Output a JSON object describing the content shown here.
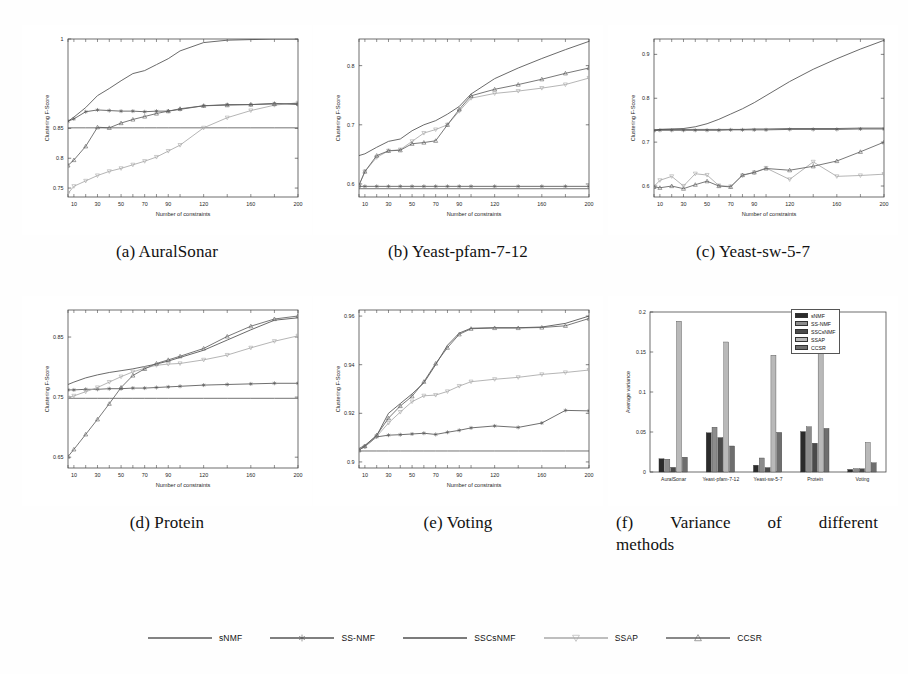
{
  "figure": {
    "axis_labels": {
      "x": "Number of constraints",
      "y": "Clustering F-Score"
    },
    "methods": [
      {
        "key": "sNMF",
        "label": "sNMF",
        "color": "#5a5a5a",
        "marker": "none",
        "bar_color": "#2b2b2b"
      },
      {
        "key": "SSNMF",
        "label": "SS-NMF",
        "color": "#555555",
        "marker": "asterisk",
        "bar_color": "#8c8c8c"
      },
      {
        "key": "SSCsNMF",
        "label": "SSCsNMF",
        "color": "#4f4f4f",
        "marker": "none",
        "bar_color": "#4a4a4a"
      },
      {
        "key": "SSAP",
        "label": "SSAP",
        "color": "#a8a8a8",
        "marker": "triangle-down",
        "bar_color": "#b9b9b9"
      },
      {
        "key": "CCSR",
        "label": "CCSR",
        "color": "#606060",
        "marker": "triangle-up",
        "bar_color": "#6e6e6e"
      }
    ]
  },
  "panels": {
    "a": {
      "tag": "(a)",
      "name": "AuralSonar",
      "caption": "(a) AuralSonar"
    },
    "b": {
      "tag": "(b)",
      "name": "Yeast-pfam-7-12",
      "caption": "(b) Yeast-pfam-7-12"
    },
    "c": {
      "tag": "(c)",
      "name": "Yeast-sw-5-7",
      "caption": "(c) Yeast-sw-5-7"
    },
    "d": {
      "tag": "(d)",
      "name": "Protein",
      "caption": "(d) Protein"
    },
    "e": {
      "tag": "(e)",
      "name": "Voting",
      "caption": "(e) Voting"
    },
    "f": {
      "tag": "(f)",
      "name": "Variance of different methods",
      "caption_line1_words": [
        "(f)",
        "Variance",
        "of",
        "different"
      ],
      "caption_line2": "methods"
    }
  },
  "chart_data": [
    {
      "id": "a",
      "type": "line",
      "title": "(a) AuralSonar",
      "xlabel": "Number of constraints",
      "ylabel": "Clustering F-Score",
      "x": [
        5,
        10,
        20,
        30,
        40,
        50,
        60,
        70,
        80,
        90,
        100,
        120,
        140,
        160,
        180,
        200
      ],
      "xticks": [
        10,
        30,
        50,
        70,
        90,
        120,
        160,
        200
      ],
      "xticklabels": [
        "10",
        "30",
        "50",
        "70",
        "90",
        "120",
        "160",
        "200"
      ],
      "yticks": [
        0.75,
        0.8,
        0.85,
        1
      ],
      "yticklabels": [
        "0.75",
        "0.8",
        "0.85",
        "1"
      ],
      "xlim": [
        5,
        200
      ],
      "ylim": [
        0.735,
        1.0
      ],
      "grid": false,
      "series": [
        {
          "name": "sNMF",
          "values": [
            0.851,
            0.851,
            0.851,
            0.851,
            0.851,
            0.851,
            0.851,
            0.851,
            0.851,
            0.851,
            0.851,
            0.851,
            0.851,
            0.851,
            0.851,
            0.851
          ]
        },
        {
          "name": "SS-NMF",
          "values": [
            0.862,
            0.866,
            0.878,
            0.881,
            0.88,
            0.879,
            0.879,
            0.878,
            0.879,
            0.879,
            0.882,
            0.888,
            0.89,
            0.89,
            0.892,
            0.89
          ]
        },
        {
          "name": "SSCsNMF",
          "values": [
            0.862,
            0.869,
            0.885,
            0.905,
            0.917,
            0.93,
            0.942,
            0.947,
            0.957,
            0.967,
            0.98,
            0.994,
            0.998,
            0.999,
            1.0,
            1.0
          ]
        },
        {
          "name": "SSAP",
          "values": [
            0.741,
            0.753,
            0.762,
            0.771,
            0.778,
            0.783,
            0.789,
            0.795,
            0.802,
            0.812,
            0.822,
            0.851,
            0.868,
            0.88,
            0.889,
            0.893
          ]
        },
        {
          "name": "CCSR",
          "values": [
            0.788,
            0.797,
            0.82,
            0.852,
            0.851,
            0.859,
            0.865,
            0.87,
            0.875,
            0.879,
            0.883,
            0.888,
            0.889,
            0.89,
            0.891,
            0.892
          ]
        }
      ]
    },
    {
      "id": "b",
      "type": "line",
      "title": "(b) Yeast-pfam-7-12",
      "xlabel": "Number of constraints",
      "ylabel": "Clustering F-Score",
      "x": [
        5,
        10,
        20,
        30,
        40,
        50,
        60,
        70,
        80,
        90,
        100,
        120,
        140,
        160,
        180,
        200
      ],
      "xticks": [
        10,
        30,
        50,
        70,
        90,
        120,
        160,
        200
      ],
      "xticklabels": [
        "10",
        "30",
        "50",
        "70",
        "90",
        "120",
        "160",
        "200"
      ],
      "yticks": [
        0.6,
        0.7,
        0.8
      ],
      "yticklabels": [
        "0.6",
        "0.7",
        "0.8"
      ],
      "xlim": [
        5,
        200
      ],
      "ylim": [
        0.578,
        0.845
      ],
      "grid": false,
      "series": [
        {
          "name": "sNMF",
          "values": [
            0.592,
            0.592,
            0.592,
            0.592,
            0.592,
            0.592,
            0.592,
            0.592,
            0.592,
            0.592,
            0.592,
            0.592,
            0.592,
            0.592,
            0.592,
            0.592
          ]
        },
        {
          "name": "SS-NMF",
          "values": [
            0.596,
            0.596,
            0.596,
            0.596,
            0.596,
            0.596,
            0.596,
            0.596,
            0.596,
            0.596,
            0.596,
            0.596,
            0.596,
            0.596,
            0.596,
            0.596
          ]
        },
        {
          "name": "SSCsNMF",
          "values": [
            0.648,
            0.651,
            0.662,
            0.672,
            0.676,
            0.69,
            0.7,
            0.707,
            0.718,
            0.731,
            0.752,
            0.778,
            0.796,
            0.812,
            0.827,
            0.841
          ]
        },
        {
          "name": "SSAP",
          "values": [
            0.598,
            0.621,
            0.645,
            0.656,
            0.658,
            0.672,
            0.686,
            0.692,
            0.7,
            0.723,
            0.745,
            0.753,
            0.757,
            0.762,
            0.768,
            0.779
          ]
        },
        {
          "name": "CCSR",
          "values": [
            0.598,
            0.621,
            0.648,
            0.656,
            0.657,
            0.668,
            0.67,
            0.673,
            0.7,
            0.726,
            0.749,
            0.76,
            0.768,
            0.777,
            0.787,
            0.796
          ]
        }
      ]
    },
    {
      "id": "c",
      "type": "line",
      "title": "(c) Yeast-sw-5-7",
      "xlabel": "Number of constraints",
      "ylabel": "Clustering F-Score",
      "x": [
        5,
        10,
        20,
        30,
        40,
        50,
        60,
        70,
        80,
        90,
        100,
        120,
        140,
        160,
        180,
        200
      ],
      "xticks": [
        10,
        30,
        50,
        70,
        90,
        120,
        160,
        200
      ],
      "xticklabels": [
        "10",
        "30",
        "50",
        "70",
        "90",
        "120",
        "160",
        "200"
      ],
      "yticks": [
        0.6,
        0.7,
        0.8,
        0.9
      ],
      "yticklabels": [
        "0.6",
        "0.7",
        "0.8",
        "0.9"
      ],
      "xlim": [
        5,
        200
      ],
      "ylim": [
        0.575,
        0.935
      ],
      "grid": false,
      "series": [
        {
          "name": "sNMF",
          "values": [
            0.728,
            0.729,
            0.729,
            0.729,
            0.729,
            0.729,
            0.729,
            0.729,
            0.729,
            0.73,
            0.73,
            0.731,
            0.731,
            0.731,
            0.732,
            0.732
          ]
        },
        {
          "name": "SS-NMF",
          "values": [
            0.726,
            0.727,
            0.727,
            0.727,
            0.727,
            0.727,
            0.727,
            0.728,
            0.728,
            0.728,
            0.728,
            0.729,
            0.729,
            0.729,
            0.73,
            0.73
          ]
        },
        {
          "name": "SSCsNMF",
          "values": [
            0.727,
            0.729,
            0.73,
            0.731,
            0.735,
            0.742,
            0.752,
            0.764,
            0.776,
            0.79,
            0.806,
            0.838,
            0.866,
            0.89,
            0.912,
            0.932
          ]
        },
        {
          "name": "SSAP",
          "values": [
            0.599,
            0.613,
            0.622,
            0.6,
            0.628,
            0.625,
            0.601,
            0.599,
            0.624,
            0.631,
            0.641,
            0.615,
            0.655,
            0.622,
            0.624,
            0.627
          ]
        },
        {
          "name": "CCSR",
          "values": [
            0.598,
            0.596,
            0.6,
            0.594,
            0.603,
            0.611,
            0.6,
            0.598,
            0.625,
            0.631,
            0.64,
            0.636,
            0.645,
            0.657,
            0.678,
            0.7
          ]
        }
      ]
    },
    {
      "id": "d",
      "type": "line",
      "title": "(d) Protein",
      "xlabel": "Number of constraints",
      "ylabel": "Clustering F-Score",
      "x": [
        5,
        10,
        20,
        30,
        40,
        50,
        60,
        70,
        80,
        90,
        100,
        120,
        140,
        160,
        180,
        200
      ],
      "xticks": [
        10,
        30,
        50,
        70,
        90,
        120,
        160,
        200
      ],
      "xticklabels": [
        "10",
        "30",
        "50",
        "70",
        "90",
        "120",
        "160",
        "200"
      ],
      "yticks": [
        0.65,
        0.75,
        0.85
      ],
      "yticklabels": [
        "0.65",
        "0.75",
        "0.85"
      ],
      "xlim": [
        5,
        200
      ],
      "ylim": [
        0.632,
        0.895
      ],
      "grid": false,
      "series": [
        {
          "name": "sNMF",
          "values": [
            0.748,
            0.748,
            0.748,
            0.748,
            0.748,
            0.748,
            0.748,
            0.748,
            0.748,
            0.748,
            0.748,
            0.748,
            0.748,
            0.748,
            0.748,
            0.748
          ]
        },
        {
          "name": "SS-NMF",
          "values": [
            0.762,
            0.762,
            0.763,
            0.763,
            0.764,
            0.764,
            0.765,
            0.765,
            0.766,
            0.767,
            0.768,
            0.77,
            0.771,
            0.772,
            0.773,
            0.773
          ]
        },
        {
          "name": "SSCsNMF",
          "values": [
            0.771,
            0.775,
            0.782,
            0.787,
            0.791,
            0.794,
            0.797,
            0.801,
            0.805,
            0.81,
            0.816,
            0.828,
            0.845,
            0.862,
            0.878,
            0.882
          ]
        },
        {
          "name": "SSAP",
          "values": [
            0.749,
            0.752,
            0.759,
            0.766,
            0.775,
            0.784,
            0.792,
            0.798,
            0.803,
            0.805,
            0.806,
            0.812,
            0.82,
            0.832,
            0.843,
            0.852
          ]
        },
        {
          "name": "CCSR",
          "values": [
            0.651,
            0.663,
            0.688,
            0.713,
            0.739,
            0.766,
            0.786,
            0.797,
            0.806,
            0.812,
            0.818,
            0.831,
            0.851,
            0.868,
            0.88,
            0.885
          ]
        }
      ]
    },
    {
      "id": "e",
      "type": "line",
      "title": "(e) Voting",
      "xlabel": "Number of constraints",
      "ylabel": "Clustering F-Score",
      "x": [
        5,
        10,
        20,
        30,
        40,
        50,
        60,
        70,
        80,
        90,
        100,
        120,
        140,
        160,
        180,
        200
      ],
      "xticks": [
        10,
        30,
        50,
        70,
        90,
        120,
        160,
        200
      ],
      "xticklabels": [
        "10",
        "30",
        "50",
        "70",
        "90",
        "120",
        "160",
        "200"
      ],
      "yticks": [
        0.9,
        0.92,
        0.94,
        0.96
      ],
      "yticklabels": [
        "0.9",
        "0.92",
        "0.94",
        "0.96"
      ],
      "xlim": [
        5,
        200
      ],
      "ylim": [
        0.8975,
        0.9625
      ],
      "grid": false,
      "series": [
        {
          "name": "sNMF",
          "values": [
            0.9045,
            0.9045,
            0.9045,
            0.9045,
            0.9045,
            0.9045,
            0.9045,
            0.9045,
            0.9045,
            0.9045,
            0.9045,
            0.9045,
            0.9045,
            0.9045,
            0.9045,
            0.9045
          ]
        },
        {
          "name": "SS-NMF",
          "values": [
            0.905,
            0.9063,
            0.9103,
            0.911,
            0.9112,
            0.9115,
            0.9118,
            0.9113,
            0.9122,
            0.913,
            0.914,
            0.9148,
            0.9142,
            0.916,
            0.9212,
            0.921
          ]
        },
        {
          "name": "SSCsNMF",
          "values": [
            0.9055,
            0.9068,
            0.9108,
            0.92,
            0.924,
            0.928,
            0.9325,
            0.94,
            0.948,
            0.953,
            0.955,
            0.9552,
            0.9552,
            0.9555,
            0.957,
            0.96
          ]
        },
        {
          "name": "SSAP",
          "values": [
            0.905,
            0.9063,
            0.9105,
            0.916,
            0.9205,
            0.9248,
            0.9272,
            0.9275,
            0.929,
            0.9312,
            0.933,
            0.934,
            0.9348,
            0.936,
            0.9368,
            0.9378
          ]
        },
        {
          "name": "CCSR",
          "values": [
            0.9048,
            0.9065,
            0.911,
            0.918,
            0.923,
            0.927,
            0.933,
            0.9405,
            0.947,
            0.9525,
            0.9548,
            0.9551,
            0.9551,
            0.9553,
            0.956,
            0.959
          ]
        }
      ]
    },
    {
      "id": "f",
      "type": "bar",
      "title": "(f) Variance of different methods",
      "xlabel": "",
      "ylabel": "Average variance",
      "categories": [
        "AuralSonar",
        "Yeast-pfam-7-12",
        "Yeast-sw-5-7",
        "Protein",
        "Voting"
      ],
      "yticks": [
        0,
        0.05,
        0.1,
        0.15,
        0.2
      ],
      "yticklabels": [
        "0",
        "0.05",
        "0.1",
        "0.15",
        "0.2"
      ],
      "ylim": [
        0,
        0.2
      ],
      "grid": false,
      "legend_position": "top-right",
      "series": [
        {
          "name": "sNMF",
          "values": [
            0.0165,
            0.049,
            0.0085,
            0.0505,
            0.0032
          ]
        },
        {
          "name": "SS-NMF",
          "values": [
            0.016,
            0.056,
            0.0175,
            0.0565,
            0.0042
          ]
        },
        {
          "name": "SSCsNMF",
          "values": [
            0.0058,
            0.043,
            0.0055,
            0.036,
            0.004
          ]
        },
        {
          "name": "SSAP",
          "values": [
            0.1885,
            0.1625,
            0.146,
            0.188,
            0.037
          ]
        },
        {
          "name": "CCSR",
          "values": [
            0.0185,
            0.0325,
            0.0495,
            0.0545,
            0.0115
          ]
        }
      ]
    }
  ],
  "legend": {
    "items": [
      {
        "label": "sNMF",
        "marker": "none"
      },
      {
        "label": "SS-NMF",
        "marker": "asterisk"
      },
      {
        "label": "SSCsNMF",
        "marker": "none"
      },
      {
        "label": "SSAP",
        "marker": "triangle-down"
      },
      {
        "label": "CCSR",
        "marker": "triangle-up"
      }
    ]
  }
}
